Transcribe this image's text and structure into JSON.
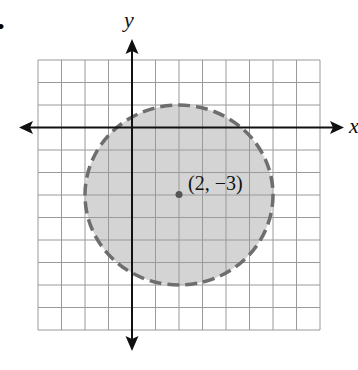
{
  "figure": {
    "bullet": "•",
    "x_axis_label": "x",
    "y_axis_label": "y",
    "center_label": "(2, −3)"
  },
  "grid": {
    "x_min": -4,
    "x_max": 8,
    "y_min": -9,
    "y_max": 3,
    "left_px": 38,
    "top_px": 60,
    "cell_w": 23.5,
    "cell_h": 22.5
  },
  "circle": {
    "center": [
      2,
      -3
    ],
    "radius": 4,
    "boundary": "dashed",
    "fill": "#d4d4d4",
    "stroke": "#6e6e6e"
  },
  "colors": {
    "grid_line": "#9a9a9a",
    "axis": "#111111",
    "point": "#555555"
  }
}
